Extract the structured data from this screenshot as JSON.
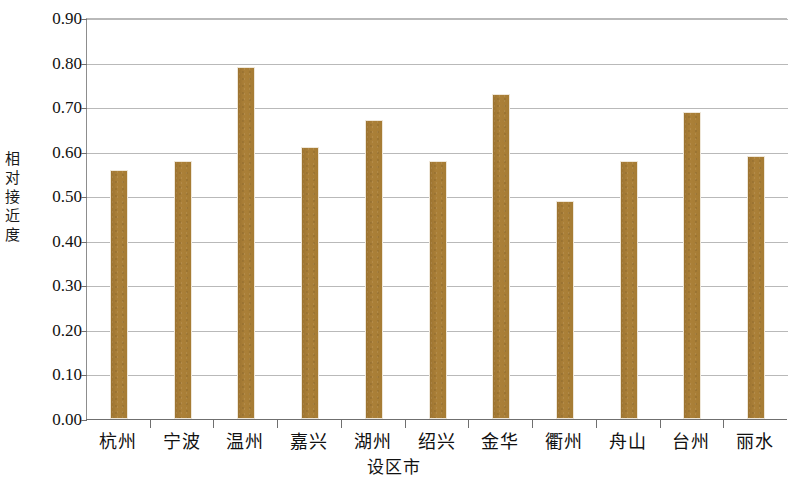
{
  "chart_data": {
    "type": "bar",
    "title": "",
    "xlabel": "设区市",
    "ylabel": "相对接近度",
    "categories": [
      "杭州",
      "宁波",
      "温州",
      "嘉兴",
      "湖州",
      "绍兴",
      "金华",
      "衢州",
      "舟山",
      "台州",
      "丽水"
    ],
    "values": [
      0.56,
      0.58,
      0.79,
      0.61,
      0.67,
      0.58,
      0.73,
      0.49,
      0.58,
      0.69,
      0.59
    ],
    "ylim": [
      0.0,
      0.9
    ],
    "ytick_step": 0.1,
    "ytick_labels": [
      "0.00",
      "0.10",
      "0.20",
      "0.30",
      "0.40",
      "0.50",
      "0.60",
      "0.70",
      "0.80",
      "0.90"
    ],
    "ytick_values": [
      0.0,
      0.1,
      0.2,
      0.3,
      0.4,
      0.5,
      0.6,
      0.7,
      0.8,
      0.9
    ],
    "grid": true,
    "grid_axis": "y",
    "legend": false,
    "legend_position": "none",
    "bar_color": "#a67c34",
    "grid_color": "#b9b9b9",
    "axis_color": "#6f6f6f"
  }
}
